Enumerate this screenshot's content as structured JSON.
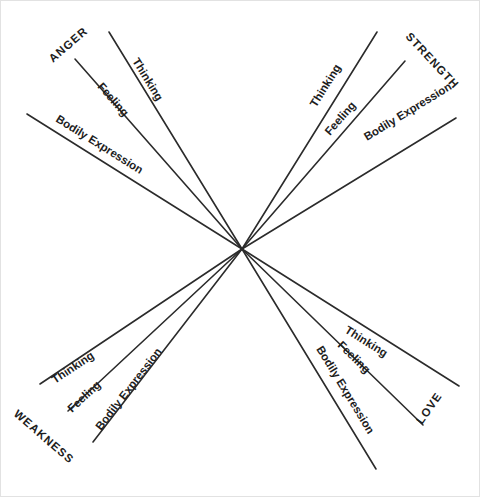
{
  "diagram": {
    "type": "radial-spoke",
    "background_color": "#ffffff",
    "line_color": "#2b2b2b",
    "text_color": "#1d1d1d",
    "border_color": "#e2e2e2",
    "center": {
      "x": 241,
      "y": 248
    },
    "poles": [
      {
        "id": "anger",
        "name": "ANGER",
        "quadrant": "upper-left",
        "label_x": 52,
        "label_y": 62,
        "label_rotation": -41,
        "rays": [
          {
            "name": "Thinking",
            "x1": 241,
            "y1": 248,
            "x2": 108,
            "y2": 31,
            "label_x": 131,
            "label_y": 60,
            "label_rotation": 58.5
          },
          {
            "name": "Feeling",
            "x1": 241,
            "y1": 248,
            "x2": 74,
            "y2": 58,
            "label_x": 96,
            "label_y": 86,
            "label_rotation": 48.7
          },
          {
            "name": "Bodily Expression",
            "x1": 241,
            "y1": 248,
            "x2": 26,
            "y2": 113,
            "label_x": 54,
            "label_y": 120,
            "label_rotation": 32.1
          }
        ]
      },
      {
        "id": "strength",
        "name": "STRENGTH",
        "quadrant": "upper-right",
        "label_x": 404,
        "label_y": 36,
        "label_rotation": 47,
        "rays": [
          {
            "name": "Thinking",
            "x1": 241,
            "y1": 248,
            "x2": 376,
            "y2": 31,
            "label_x": 315,
            "label_y": 107,
            "label_rotation": -58.1
          },
          {
            "name": "Feeling",
            "x1": 241,
            "y1": 248,
            "x2": 404,
            "y2": 60,
            "label_x": 329,
            "label_y": 135,
            "label_rotation": -49.1
          },
          {
            "name": "Bodily Expression",
            "x1": 241,
            "y1": 248,
            "x2": 455,
            "y2": 117,
            "label_x": 366,
            "label_y": 140,
            "label_rotation": -31.5
          }
        ]
      },
      {
        "id": "weakness",
        "name": "WEAKNESS",
        "quadrant": "lower-left",
        "label_x": 12,
        "label_y": 414,
        "label_rotation": 41,
        "rays": [
          {
            "name": "Thinking",
            "x1": 241,
            "y1": 248,
            "x2": 39,
            "y2": 383,
            "label_x": 54,
            "label_y": 383,
            "label_rotation": -33.7
          },
          {
            "name": "Feeling",
            "x1": 241,
            "y1": 248,
            "x2": 67,
            "y2": 410,
            "label_x": 71,
            "label_y": 412,
            "label_rotation": -42.9
          },
          {
            "name": "Bodily Expression",
            "x1": 241,
            "y1": 248,
            "x2": 92,
            "y2": 441,
            "label_x": 100,
            "label_y": 430,
            "label_rotation": -52.3
          }
        ]
      },
      {
        "id": "love",
        "name": "LOVE",
        "quadrant": "lower-right",
        "label_x": 421,
        "label_y": 424,
        "label_rotation": -55,
        "rays": [
          {
            "name": "Thinking",
            "x1": 241,
            "y1": 248,
            "x2": 458,
            "y2": 385,
            "label_x": 343,
            "label_y": 331,
            "label_rotation": 32.2
          },
          {
            "name": "Feeling",
            "x1": 241,
            "y1": 248,
            "x2": 422,
            "y2": 424,
            "label_x": 336,
            "label_y": 345,
            "label_rotation": 44.2
          },
          {
            "name": "Bodily Expression",
            "x1": 241,
            "y1": 248,
            "x2": 375,
            "y2": 468,
            "label_x": 315,
            "label_y": 348,
            "label_rotation": 58.6
          }
        ]
      }
    ]
  }
}
